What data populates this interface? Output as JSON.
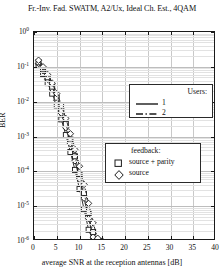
{
  "chart_data": {
    "type": "line",
    "title": "Fr.-Inv. Fad. SWATM, A2/Ux, Ideal Ch. Est., 4QAM",
    "xlabel": "average SNR at the reception antennas [dB]",
    "ylabel": "BER",
    "xlim": [
      0,
      40
    ],
    "ylim": [
      1e-06,
      1
    ],
    "yscale": "log",
    "grid": true,
    "xticks": [
      0,
      5,
      10,
      15,
      20,
      25,
      30,
      35,
      40
    ],
    "xtick_labels": [
      "0",
      "5",
      "10",
      "15",
      "20",
      "25",
      "30",
      "35",
      "40"
    ],
    "yticks": [
      1,
      0.1,
      0.01,
      0.001,
      0.0001,
      1e-05,
      1e-06
    ],
    "ytick_labels": [
      "10",
      "10",
      "10",
      "10",
      "10",
      "10",
      "10"
    ],
    "ytick_exponents": [
      "0",
      "-1",
      "-2",
      "-3",
      "-4",
      "-5",
      "-6"
    ],
    "legends": [
      {
        "name": "users-legend",
        "title": "Users:",
        "entries": [
          {
            "label": "1",
            "style": "solid"
          },
          {
            "label": "2",
            "style": "dashdot"
          }
        ]
      },
      {
        "name": "feedback-legend",
        "title": "feedback:",
        "entries": [
          {
            "label": "source + parity",
            "marker": "square"
          },
          {
            "label": "source",
            "marker": "diamond"
          }
        ]
      }
    ],
    "series": [
      {
        "name": "1 user, source + parity",
        "users": "1",
        "feedback": "source + parity",
        "style": "solid",
        "marker": "square",
        "color": "#1a1a1a",
        "x": [
          1,
          2,
          3,
          4,
          5,
          6,
          7,
          8,
          9,
          10,
          11,
          12,
          13
        ],
        "y": [
          0.105,
          0.062,
          0.034,
          0.017,
          0.0078,
          0.0031,
          0.0011,
          0.00036,
          0.00011,
          3.1e-05,
          8.2e-06,
          2.1e-06,
          1e-06
        ]
      },
      {
        "name": "1 user, source",
        "users": "1",
        "feedback": "source",
        "style": "solid",
        "marker": "diamond",
        "color": "#1a1a1a",
        "x": [
          1,
          2,
          3,
          4,
          5,
          6,
          7,
          8,
          9,
          10,
          11,
          12,
          13,
          14
        ],
        "y": [
          0.125,
          0.077,
          0.044,
          0.023,
          0.011,
          0.0047,
          0.0018,
          0.00062,
          0.0002,
          6e-05,
          1.7e-05,
          4.4e-06,
          1.3e-06,
          1e-06
        ]
      },
      {
        "name": "2 users, source + parity",
        "users": "2",
        "feedback": "source + parity",
        "style": "dashdot",
        "marker": "square",
        "color": "#1a1a1a",
        "x": [
          1,
          2,
          3,
          4,
          5,
          6,
          7,
          8,
          9,
          10,
          11,
          12,
          13,
          14
        ],
        "y": [
          0.135,
          0.085,
          0.05,
          0.027,
          0.013,
          0.0058,
          0.0023,
          0.00082,
          0.00027,
          8.4e-05,
          2.4e-05,
          6.4e-06,
          1.8e-06,
          1e-06
        ]
      },
      {
        "name": "2 users, source",
        "users": "2",
        "feedback": "source",
        "style": "dashdot",
        "marker": "diamond",
        "color": "#1a1a1a",
        "x": [
          1,
          2,
          3,
          4,
          5,
          6,
          7,
          8,
          9,
          10,
          11,
          12,
          13,
          14,
          15
        ],
        "y": [
          0.155,
          0.1,
          0.06,
          0.034,
          0.017,
          0.0078,
          0.0033,
          0.0012,
          0.00042,
          0.00014,
          4.2e-05,
          1.2e-05,
          3.3e-06,
          1.2e-06,
          1e-06
        ]
      }
    ]
  }
}
